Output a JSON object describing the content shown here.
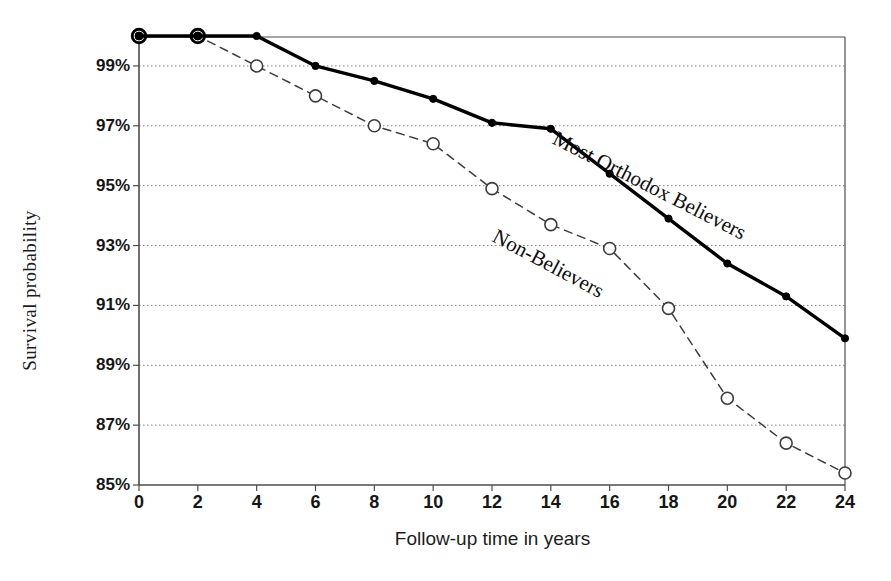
{
  "axes": {
    "ylabel": "Survival probability",
    "xlabel": "Follow-up time in years",
    "yticks": [
      "99%",
      "97%",
      "95%",
      "93%",
      "91%",
      "89%",
      "87%",
      "85%"
    ],
    "xticks": [
      "0",
      "2",
      "4",
      "6",
      "8",
      "10",
      "12",
      "14",
      "16",
      "18",
      "20",
      "22",
      "24"
    ]
  },
  "annotations": {
    "orthodox_label": "Most Orthodox Believers",
    "nonbelievers_label": "Non-Believers"
  },
  "colors": {
    "solid_line": "#000000",
    "dashed_line": "#3d3d3d",
    "gridline": "#808080",
    "axis": "#4d4d4d",
    "background": "#ffffff"
  },
  "chart_data": {
    "type": "line",
    "title": "",
    "xlabel": "Follow-up time in years",
    "ylabel": "Survival probability",
    "xlim": [
      0,
      24
    ],
    "ylim": [
      85,
      100
    ],
    "xticks": [
      0,
      2,
      4,
      6,
      8,
      10,
      12,
      14,
      16,
      18,
      20,
      22,
      24
    ],
    "yticks": [
      99,
      97,
      95,
      93,
      91,
      89,
      87,
      85
    ],
    "ytick_labels": [
      "99%",
      "97%",
      "95%",
      "93%",
      "91%",
      "89%",
      "87%",
      "85%"
    ],
    "grid": "horizontal-dotted",
    "legend": "inline-curve-labels",
    "x": [
      0,
      2,
      4,
      6,
      8,
      10,
      12,
      14,
      16,
      18,
      20,
      22,
      24
    ],
    "series": [
      {
        "name": "Most Orthodox Believers",
        "marker": "filled-circle",
        "linestyle": "solid",
        "values": [
          100.0,
          100.0,
          100.0,
          99.0,
          98.5,
          97.9,
          97.1,
          96.9,
          95.4,
          93.9,
          92.4,
          91.3,
          89.9
        ]
      },
      {
        "name": "Non-Believers",
        "marker": "open-circle",
        "linestyle": "dashed",
        "values": [
          100.0,
          100.0,
          99.0,
          98.0,
          97.0,
          96.4,
          94.9,
          93.7,
          92.9,
          90.9,
          87.9,
          86.4,
          85.4
        ]
      }
    ]
  }
}
